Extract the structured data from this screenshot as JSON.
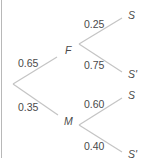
{
  "diagram": {
    "type": "probability-tree",
    "line_color": "#c4c4c4",
    "text_color": "#4a4a4a",
    "root": {
      "branches": [
        {
          "probability": "0.65",
          "node": "F",
          "branches": [
            {
              "probability": "0.25",
              "node": "S"
            },
            {
              "probability": "0.75",
              "node": "S'"
            }
          ]
        },
        {
          "probability": "0.35",
          "node": "M",
          "branches": [
            {
              "probability": "0.60",
              "node": "S"
            },
            {
              "probability": "0.40",
              "node": "S'"
            }
          ]
        }
      ]
    }
  }
}
